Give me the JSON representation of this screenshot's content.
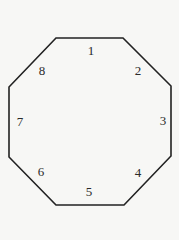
{
  "diagram": {
    "shape": "octagon",
    "stroke_color": "#222222",
    "background_color": "#f7f7f5",
    "vertices": [
      [
        56,
        38
      ],
      [
        123,
        38
      ],
      [
        171,
        86
      ],
      [
        171,
        156
      ],
      [
        124,
        205
      ],
      [
        56,
        205
      ],
      [
        9,
        157
      ],
      [
        9,
        87
      ]
    ],
    "side_labels": [
      {
        "text": "1",
        "x": 91,
        "y": 50
      },
      {
        "text": "2",
        "x": 138,
        "y": 70
      },
      {
        "text": "3",
        "x": 163,
        "y": 120
      },
      {
        "text": "4",
        "x": 138,
        "y": 172
      },
      {
        "text": "5",
        "x": 89,
        "y": 191
      },
      {
        "text": "6",
        "x": 41,
        "y": 171
      },
      {
        "text": "7",
        "x": 20,
        "y": 121
      },
      {
        "text": "8",
        "x": 42,
        "y": 70
      }
    ]
  }
}
